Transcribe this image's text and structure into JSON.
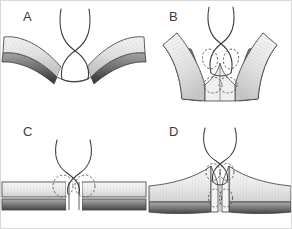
{
  "figure": {
    "background_color": "#ffffff",
    "border_color": "#d8d8d8",
    "width": 292,
    "height": 229,
    "style": "grayscale line-and-tone medical illustration",
    "layout": "2x2 panel grid"
  },
  "palette": {
    "outline": "#4a4a4a",
    "suture_thread": "#3a3a3a",
    "dashed_marker": "#555555",
    "tissue_light_top": "#f2f2f2",
    "tissue_light_bottom": "#cfcfcf",
    "tissue_dark_top": "#9a9a9a",
    "tissue_dark_bottom": "#4f4f4f",
    "striation": "#b8b8b8",
    "label_text": "#3b3b3b"
  },
  "panels": [
    {
      "id": "a",
      "label": "A",
      "caption": "Everted tissue edges with crossed suture strands passing above the apposed margins",
      "tissue_orientation": "wing-shaped, sloping downward and outward from center",
      "suture_crossing": true,
      "dashed_markers": 0,
      "layer_count": 2
    },
    {
      "id": "b",
      "label": "B",
      "caption": "Tissue flaps drawn together, suture loops encircling the bite sites marked by dashed outlines",
      "tissue_orientation": "U-shaped, curving downward and outward from center",
      "suture_crossing": true,
      "dashed_markers": 4,
      "layer_count": 2
    },
    {
      "id": "c",
      "label": "C",
      "caption": "Flat apposed tissue layers with a vertical gap and suture strands crossing above",
      "tissue_orientation": "horizontal flat layers with central vertical gap",
      "suture_crossing": true,
      "dashed_markers": 2,
      "layer_count": 2
    },
    {
      "id": "d",
      "label": "D",
      "caption": "Tissue edges raised and inverted at the midline with suture loops around the bite sites",
      "tissue_orientation": "horizontal layers rising into a central peak",
      "suture_crossing": true,
      "dashed_markers": 4,
      "layer_count": 2
    }
  ]
}
